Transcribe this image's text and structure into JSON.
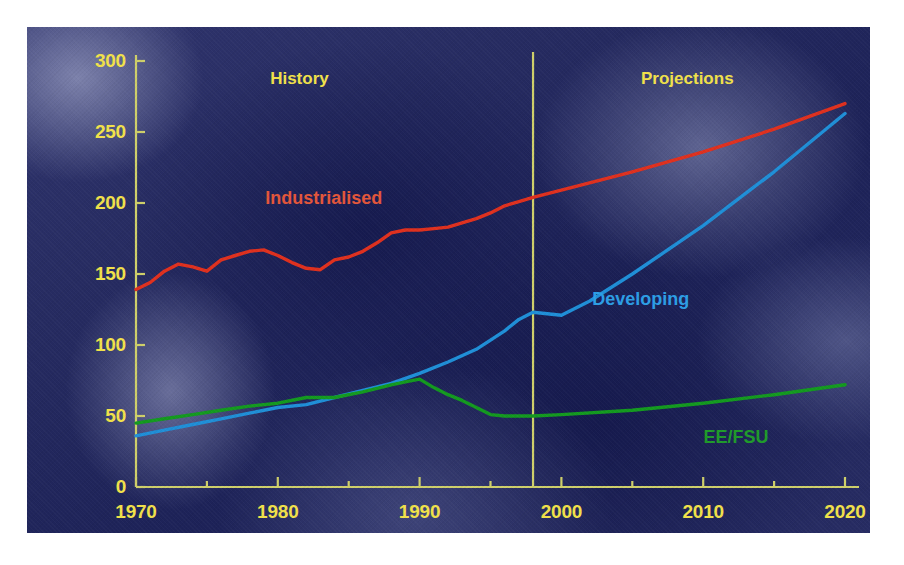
{
  "chart_data": {
    "type": "line",
    "title": "",
    "xlabel": "",
    "ylabel": "Quadrillion Btu",
    "xlim": [
      1970,
      2020
    ],
    "ylim": [
      0,
      300
    ],
    "ytick_values": [
      0,
      50,
      100,
      150,
      200,
      250,
      300
    ],
    "ytick_labels": [
      "0",
      "50",
      "100",
      "150",
      "200",
      "250",
      "300"
    ],
    "xtick_labels": [
      "1970",
      "1980",
      "1990",
      "2000",
      "2010",
      "2020"
    ],
    "xtick_values": [
      1970,
      1980,
      1990,
      2000,
      2010,
      2020
    ],
    "xminor_step": 5,
    "grid": false,
    "legend": "inline-series-labels",
    "annotations": [
      {
        "text": "History",
        "x": 1982,
        "y": 287
      },
      {
        "text": "Projections",
        "x": 2009,
        "y": 287
      },
      {
        "text": "history_projection_divider",
        "x": 1998
      }
    ],
    "history_projection_boundary": 1998,
    "series": [
      {
        "name": "Industrialised",
        "color": "#e0301e",
        "label_color": "#e4563a",
        "label_x": 1983,
        "label_y": 202,
        "x": [
          1970,
          1971,
          1972,
          1973,
          1974,
          1975,
          1976,
          1977,
          1978,
          1979,
          1980,
          1981,
          1982,
          1983,
          1984,
          1985,
          1986,
          1987,
          1988,
          1989,
          1990,
          1991,
          1992,
          1993,
          1994,
          1995,
          1996,
          1997,
          1998,
          2000,
          2005,
          2010,
          2015,
          2020
        ],
        "y": [
          139,
          144,
          152,
          157,
          155,
          152,
          160,
          163,
          166,
          167,
          163,
          158,
          154,
          153,
          160,
          162,
          166,
          172,
          179,
          181,
          181,
          182,
          183,
          186,
          189,
          193,
          198,
          201,
          204,
          209,
          222,
          236,
          252,
          270
        ]
      },
      {
        "name": "Developing",
        "color": "#1f8fd8",
        "label_color": "#2c9ee6",
        "label_x": 2005,
        "label_y": 131,
        "x": [
          1970,
          1972,
          1974,
          1976,
          1978,
          1980,
          1982,
          1984,
          1986,
          1988,
          1990,
          1992,
          1994,
          1996,
          1997,
          1998,
          2000,
          2002,
          2005,
          2010,
          2015,
          2020
        ],
        "y": [
          36,
          40,
          44,
          48,
          52,
          56,
          58,
          63,
          68,
          73,
          80,
          88,
          97,
          110,
          118,
          123,
          121,
          131,
          150,
          184,
          222,
          263
        ]
      },
      {
        "name": "EE/FSU",
        "color": "#139a1f",
        "label_color": "#1f9b2a",
        "label_x": 2012,
        "label_y": 34,
        "x": [
          1970,
          1972,
          1974,
          1976,
          1978,
          1980,
          1982,
          1984,
          1986,
          1988,
          1989,
          1990,
          1991,
          1992,
          1993,
          1994,
          1995,
          1996,
          1998,
          2000,
          2005,
          2010,
          2015,
          2020
        ],
        "y": [
          45,
          48,
          51,
          54,
          57,
          59,
          63,
          63,
          67,
          72,
          74,
          76,
          70,
          65,
          61,
          56,
          51,
          50,
          50,
          51,
          54,
          59,
          65,
          72
        ]
      }
    ]
  },
  "axis": {
    "y_title": "Quadrillion Btu",
    "tick_color": "#f2e24a",
    "axis_color": "#cfd06a"
  },
  "eras": {
    "history_label": "History",
    "projections_label": "Projections"
  },
  "series_labels": {
    "industrialised": "Industrialised",
    "developing": "Developing",
    "ee_fsu": "EE/FSU"
  }
}
